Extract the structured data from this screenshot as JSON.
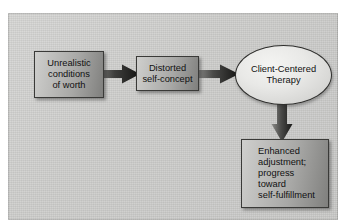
{
  "figure": {
    "panel_background": "#c9c9c7",
    "node_fill_dark": "#7f7f7d",
    "node_fill_light": "#cfcfcd",
    "oval_fill": "#e9e9e7",
    "text_color": "#111111",
    "border_color": "#3a3a38"
  },
  "nodes": [
    {
      "id": "unrealistic-conditions-of-worth",
      "shape": "rectangle",
      "text": "Unrealistic\nconditions\nof worth"
    },
    {
      "id": "distorted-self-concept",
      "shape": "rectangle",
      "text": "Distorted\nself-concept"
    },
    {
      "id": "client-centered-therapy",
      "shape": "ellipse",
      "text": "Client-Centered\nTherapy"
    },
    {
      "id": "enhanced-adjustment",
      "shape": "rectangle",
      "text": "Enhanced\nadjustment;\nprogress\ntoward\nself-fulfillment"
    }
  ],
  "arrows": [
    {
      "id": "arrow-conditions-to-selfconcept",
      "from": "unrealistic-conditions-of-worth",
      "to": "distorted-self-concept",
      "direction": "right"
    },
    {
      "id": "arrow-selfconcept-to-therapy",
      "from": "distorted-self-concept",
      "to": "client-centered-therapy",
      "direction": "right"
    },
    {
      "id": "arrow-therapy-to-outcome",
      "from": "client-centered-therapy",
      "to": "enhanced-adjustment",
      "direction": "down"
    }
  ]
}
